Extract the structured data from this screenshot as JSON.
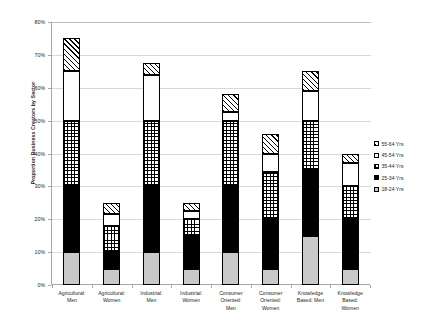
{
  "chart_data": {
    "type": "bar",
    "subtype": "stacked-column",
    "title": "",
    "xlabel": "",
    "ylabel": "Proportion Business Creators by Sector",
    "ylim": [
      0,
      80
    ],
    "ytick_labels": [
      "80%",
      "70%",
      "60%",
      "50%",
      "40%",
      "30%",
      "20%",
      "10%",
      "0%"
    ],
    "ytick_values": [
      80,
      70,
      60,
      50,
      40,
      30,
      20,
      10,
      0
    ],
    "yunit": "%",
    "grid": true,
    "legend_position": "right",
    "categories": [
      "Agricultural: Men",
      "Agricultural: Women",
      "Industrial: Men",
      "Industrial: Women",
      "Consumer Oriented: Men",
      "Consumer Oriented: Women",
      "Knowledge Based: Men",
      "Knowledge Based: Women"
    ],
    "category_lines": [
      [
        "Agricultural:",
        "Men"
      ],
      [
        "Agricultural:",
        "Women"
      ],
      [
        "Industrial:",
        "Men"
      ],
      [
        "Industrial:",
        "Women"
      ],
      [
        "Consumer",
        "Oriented:",
        "Men"
      ],
      [
        "Consumer",
        "Oriented:",
        "Women"
      ],
      [
        "Knowledge",
        "Based: Men"
      ],
      [
        "Knowledge",
        "Based:",
        "Women"
      ]
    ],
    "series": [
      {
        "name": "18-24 Yrs",
        "pattern": "solid-gray",
        "values": [
          10,
          5,
          10,
          5,
          10,
          5,
          15,
          5
        ]
      },
      {
        "name": "25-34 Yrs",
        "pattern": "solid-black",
        "values": [
          20,
          5,
          20,
          10,
          20,
          15,
          20,
          15
        ]
      },
      {
        "name": "35-44 Yrs",
        "pattern": "checkered",
        "values": [
          20,
          8,
          20,
          5,
          20,
          14.5,
          15,
          10
        ]
      },
      {
        "name": "45-54 Yrs",
        "pattern": "white",
        "values": [
          15,
          3.5,
          14,
          2.5,
          2.5,
          5.5,
          9,
          7
        ]
      },
      {
        "name": "55-64 Yrs",
        "pattern": "diagonal-hatch",
        "values": [
          10,
          3.5,
          3.5,
          2.5,
          5.5,
          6,
          6,
          3
        ]
      }
    ],
    "totals": [
      75,
      25,
      67.5,
      25,
      58,
      46,
      65,
      40
    ],
    "legend_entries": [
      {
        "label": "55-64 Yrs",
        "pattern": "diagonal-hatch"
      },
      {
        "label": "45-54 Yrs",
        "pattern": "white"
      },
      {
        "label": "35-44 Yrs",
        "pattern": "checkered"
      },
      {
        "label": "25-34 Yrs",
        "pattern": "solid-black"
      },
      {
        "label": "18-24 Yrs",
        "pattern": "solid-gray"
      }
    ],
    "colors": {
      "gray_fill": "#c9c9c9",
      "black_fill": "#000000",
      "white_fill": "#ffffff",
      "gridline": "#d9d9d9",
      "axis": "#a6a6a6",
      "text": "#231f20"
    }
  }
}
